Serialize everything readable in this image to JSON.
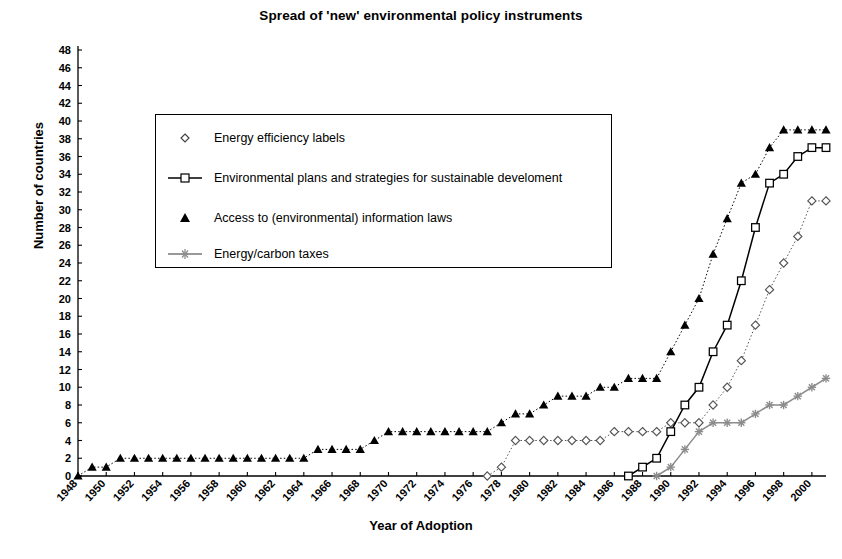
{
  "chart_data": {
    "type": "line",
    "title": "Spread of 'new' environmental policy instruments",
    "xlabel": "Year  of Adoption",
    "ylabel": "Number of countries",
    "ylim": [
      0,
      48
    ],
    "ytick_step": 2,
    "xlim": [
      1948,
      2001
    ],
    "xtick_step": 2,
    "grid": false,
    "legend_position": "upper-left-inside",
    "x": [
      1948,
      1949,
      1950,
      1951,
      1952,
      1953,
      1954,
      1955,
      1956,
      1957,
      1958,
      1959,
      1960,
      1961,
      1962,
      1963,
      1964,
      1965,
      1966,
      1967,
      1968,
      1969,
      1970,
      1971,
      1972,
      1973,
      1974,
      1975,
      1976,
      1977,
      1978,
      1979,
      1980,
      1981,
      1982,
      1983,
      1984,
      1985,
      1986,
      1987,
      1988,
      1989,
      1990,
      1991,
      1992,
      1993,
      1994,
      1995,
      1996,
      1997,
      1998,
      1999,
      2000,
      2001
    ],
    "series": [
      {
        "name": "Energy efficiency labels",
        "marker": "diamond-open",
        "line": "dotted",
        "color": "#555555",
        "values": [
          null,
          null,
          null,
          null,
          null,
          null,
          null,
          null,
          null,
          null,
          null,
          null,
          null,
          null,
          null,
          null,
          null,
          null,
          null,
          null,
          null,
          null,
          null,
          null,
          null,
          null,
          null,
          null,
          null,
          0,
          1,
          4,
          4,
          4,
          4,
          4,
          4,
          4,
          5,
          5,
          5,
          5,
          6,
          6,
          6,
          8,
          10,
          13,
          17,
          21,
          24,
          27,
          31,
          31
        ]
      },
      {
        "name": "Environmental plans and strategies for sustainable develoment",
        "marker": "square-open",
        "line": "solid",
        "color": "#000000",
        "values": [
          null,
          null,
          null,
          null,
          null,
          null,
          null,
          null,
          null,
          null,
          null,
          null,
          null,
          null,
          null,
          null,
          null,
          null,
          null,
          null,
          null,
          null,
          null,
          null,
          null,
          null,
          null,
          null,
          null,
          null,
          null,
          null,
          null,
          null,
          null,
          null,
          null,
          null,
          null,
          0,
          1,
          2,
          5,
          8,
          10,
          14,
          17,
          22,
          28,
          33,
          34,
          36,
          37,
          37
        ]
      },
      {
        "name": "Access to (environmental) information laws",
        "marker": "triangle-filled",
        "line": "dotted",
        "color": "#000000",
        "values": [
          0,
          1,
          1,
          2,
          2,
          2,
          2,
          2,
          2,
          2,
          2,
          2,
          2,
          2,
          2,
          2,
          2,
          3,
          3,
          3,
          3,
          4,
          5,
          5,
          5,
          5,
          5,
          5,
          5,
          5,
          6,
          7,
          7,
          8,
          9,
          9,
          9,
          10,
          10,
          11,
          11,
          11,
          14,
          17,
          20,
          25,
          29,
          33,
          34,
          37,
          39,
          39,
          39,
          39
        ]
      },
      {
        "name": "Energy/carbon taxes",
        "marker": "star",
        "line": "solid",
        "color": "#8c8c8c",
        "values": [
          null,
          null,
          null,
          null,
          null,
          null,
          null,
          null,
          null,
          null,
          null,
          null,
          null,
          null,
          null,
          null,
          null,
          null,
          null,
          null,
          null,
          null,
          null,
          null,
          null,
          null,
          null,
          null,
          null,
          null,
          null,
          null,
          null,
          null,
          null,
          null,
          null,
          null,
          null,
          null,
          null,
          0,
          1,
          3,
          5,
          6,
          6,
          6,
          7,
          8,
          8,
          9,
          10,
          11
        ]
      }
    ],
    "yticks": [
      0,
      2,
      4,
      6,
      8,
      10,
      12,
      14,
      16,
      18,
      20,
      22,
      24,
      26,
      28,
      30,
      32,
      34,
      36,
      38,
      40,
      42,
      44,
      46,
      48
    ],
    "xticks": [
      1948,
      1950,
      1952,
      1954,
      1956,
      1958,
      1960,
      1962,
      1964,
      1966,
      1968,
      1970,
      1972,
      1974,
      1976,
      1978,
      1980,
      1982,
      1984,
      1986,
      1988,
      1990,
      1992,
      1994,
      1996,
      1998,
      2000
    ]
  }
}
